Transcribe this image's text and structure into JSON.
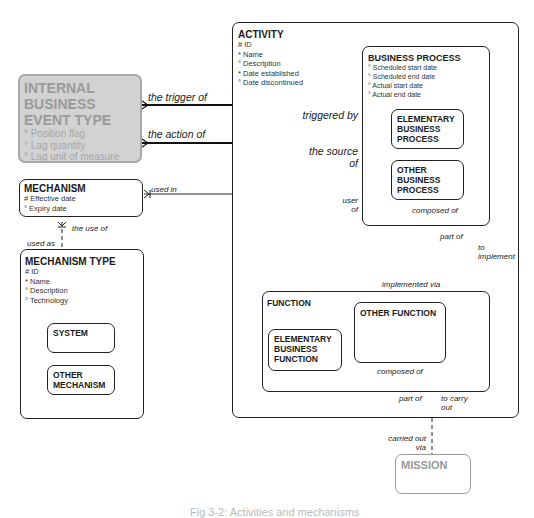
{
  "entities": {
    "activity": {
      "title": "ACTIVITY",
      "attributes": [
        "# ID",
        "* Name",
        "° Description",
        "* Date established",
        "° Date discontinued"
      ]
    },
    "business_process": {
      "title": "BUSINESS PROCESS",
      "attributes": [
        "° Scheduled start date",
        "° Scheduled end date",
        "° Actual start date",
        "° Actual end date"
      ],
      "subtypes": [
        "ELEMENTARY BUSINESS PROCESS",
        "OTHER BUSINESS PROCESS"
      ]
    },
    "internal_business_event_type": {
      "title": "INTERNAL BUSINESS EVENT TYPE",
      "attributes": [
        "* Position flag",
        "° Lag quantity",
        "° Lag unit of measure"
      ]
    },
    "mechanism": {
      "title": "MECHANISM",
      "attributes": [
        "# Effective date",
        "° Expiry date"
      ]
    },
    "mechanism_type": {
      "title": "MECHANISM TYPE",
      "attributes": [
        "# ID",
        "* Name",
        "° Description",
        "° Technology"
      ],
      "subtypes": [
        "SYSTEM",
        "OTHER MECHANISM"
      ]
    },
    "function": {
      "title": "FUNCTION",
      "subtypes": [
        "ELEMENTARY BUSINESS FUNCTION",
        "OTHER FUNCTION"
      ]
    },
    "mission": {
      "title": "MISSION"
    }
  },
  "relationships": {
    "trigger_of": "the trigger of",
    "triggered_by": "triggered by",
    "action_of": "the action of",
    "source_of": "the source of",
    "used_in": "used in",
    "user_of": "user of",
    "the_use_of": "the use of",
    "used_as": "used as",
    "bp_composed_of": "composed of",
    "bp_part_of": "part of",
    "to_implement": "to implement",
    "implemented_via": "implemented via",
    "fn_composed_of": "composed of",
    "fn_part_of": "part of",
    "to_carry_out": "to carry out",
    "carried_out_via": "carried out via"
  },
  "caption": "Fig 3-2: Activities and mechanisms"
}
